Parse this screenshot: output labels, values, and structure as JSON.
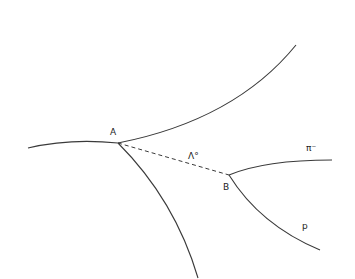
{
  "diagram": {
    "vertices": [
      {
        "id": "A",
        "label": "A",
        "x": 118,
        "y": 143
      },
      {
        "id": "B",
        "label": "B",
        "x": 229,
        "y": 175
      }
    ],
    "tracks": [
      {
        "id": "incoming",
        "from": "left",
        "to": "A",
        "style": "solid"
      },
      {
        "id": "upper-right",
        "from": "A",
        "to": "upper-right",
        "style": "solid"
      },
      {
        "id": "down",
        "from": "A",
        "to": "bottom",
        "style": "solid"
      },
      {
        "id": "lambda",
        "from": "A",
        "to": "B",
        "style": "dashed",
        "label": "Λ°"
      },
      {
        "id": "pion",
        "from": "B",
        "to": "right",
        "style": "solid",
        "label": "π⁻"
      },
      {
        "id": "proton",
        "from": "B",
        "to": "lower-right",
        "style": "solid",
        "label": "p"
      }
    ],
    "labels": {
      "vertex_a": "A",
      "vertex_b": "B",
      "lambda": "Λ°",
      "pion": "π⁻",
      "proton": "p"
    }
  }
}
